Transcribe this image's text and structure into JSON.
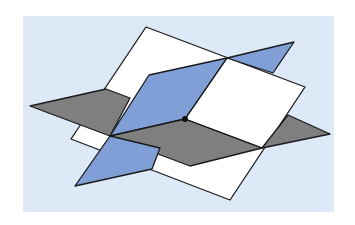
{
  "diagram": {
    "background": {
      "x": 23,
      "y": 16,
      "width": 311,
      "height": 196,
      "fill": "#dde9f6"
    },
    "stroke": "#1a1a1a",
    "colors": {
      "white_plane": "#ffffff",
      "blue_plane": "#7f9fd6",
      "gray_plane": "#7f7f7f"
    },
    "point": {
      "x": 185,
      "y": 119,
      "r": 3,
      "fill": "#111111"
    }
  }
}
